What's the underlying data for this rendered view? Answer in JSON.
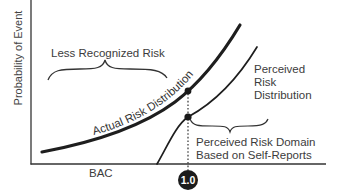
{
  "figure": {
    "y_axis_label": "Probability of Event",
    "x_axis_label": "BAC",
    "x_marker_label": "1.0",
    "annotations": {
      "less_recognized_risk": "Less Recognized Risk",
      "actual_risk_distribution": "Actual Risk Distribution",
      "perceived_risk_distribution_lines": [
        "Perceived",
        "Risk",
        "Distribution"
      ],
      "perceived_risk_domain_lines": [
        "Perceived Risk Domain",
        "Based on Self-Reports"
      ]
    },
    "curves": [
      {
        "name": "Actual Risk Distribution",
        "style": "thick solid"
      },
      {
        "name": "Perceived Risk Distribution",
        "style": "thin solid"
      }
    ],
    "marker": {
      "x_value": "1.0",
      "style": "dotted vertical line with dots at curve intersections"
    },
    "colors": {
      "line": "#222222",
      "text": "#3c3c3c",
      "badge": "#1c1c1c"
    }
  }
}
